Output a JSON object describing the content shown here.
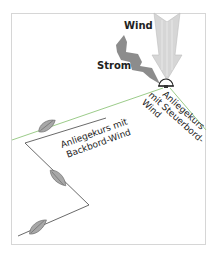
{
  "diagram": {
    "labels": {
      "wind": "Wind",
      "current": "Strom",
      "port_tack_line1": "Anliegekurs mit",
      "port_tack_line2": "Backbord-Wind",
      "starboard_tack_line1": "Anliegekurs",
      "starboard_tack_line2": "mit Steuerbord-",
      "starboard_tack_line3": "Wind"
    },
    "colors": {
      "layline": "#9ccc8a",
      "wind_arrow": "#d4d4d4",
      "current_arrow": "#8c8c8c",
      "boat": "#a8a8a8",
      "course": "#444444",
      "frame": "#d6d6d6"
    }
  }
}
